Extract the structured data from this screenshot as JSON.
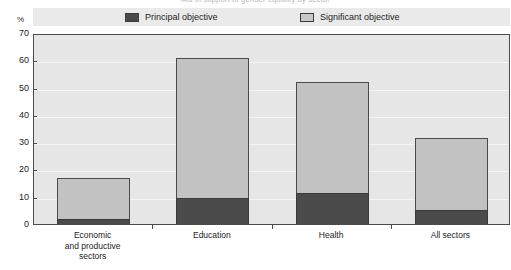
{
  "figure": {
    "cropped_title": "Aid in support of gender equality by sector",
    "axis_unit": "%"
  },
  "legend": {
    "position": "top",
    "items": [
      {
        "label": "Principal objective",
        "swatch": "dark-filled-square",
        "color": "#4b4b4b"
      },
      {
        "label": "Significant objective",
        "swatch": "light-filled-square",
        "color": "#c2c2c2"
      }
    ]
  },
  "chart_data": {
    "type": "bar",
    "title": "Aid in support of gender equality by sector",
    "xlabel": "",
    "ylabel": "%",
    "ylim": [
      0,
      70
    ],
    "yticks": [
      0,
      10,
      20,
      30,
      40,
      50,
      60,
      70
    ],
    "grid": true,
    "stacked": true,
    "categories": [
      "Economic\nand productive\nsectors",
      "Education",
      "Health",
      "All sectors"
    ],
    "category_labels": [
      [
        "Economic",
        "and productive",
        "sectors"
      ],
      [
        "Education"
      ],
      [
        "Health"
      ],
      [
        "All sectors"
      ]
    ],
    "series": [
      {
        "name": "Principal objective",
        "color": "#4b4b4b",
        "values": [
          2,
          9.5,
          11.5,
          5
        ]
      },
      {
        "name": "Significant objective",
        "color": "#c2c2c2",
        "values": [
          15,
          51.5,
          40.5,
          26.5
        ]
      }
    ],
    "totals": [
      17,
      61,
      52,
      31.5
    ]
  },
  "colors": {
    "plot_background": "#e6e6e6",
    "legend_background": "#eaeaea",
    "axis": "#4b4b4b",
    "gridline": "#f4f4f4",
    "principal": "#4b4b4b",
    "significant": "#c2c2c2"
  }
}
